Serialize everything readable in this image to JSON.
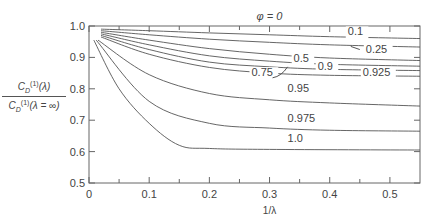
{
  "chart_data": {
    "type": "line",
    "title": "φ = 0",
    "xlabel": "1/λ",
    "ylabel": "C_D^(1)(λ) / C_D^(1)(λ = ∞)",
    "xlim": [
      0,
      0.55
    ],
    "ylim": [
      0.5,
      1.0
    ],
    "xticks": [
      "0",
      "0.1",
      "0.2",
      "0.3",
      "0.4",
      "0.5"
    ],
    "yticks": [
      "0.5",
      "0.6",
      "0.7",
      "0.8",
      "0.9",
      "1.0"
    ],
    "grid": false,
    "series": [
      {
        "name": "0.1",
        "x": [
          0.02,
          0.1,
          0.2,
          0.3,
          0.4,
          0.55
        ],
        "y": [
          0.99,
          0.985,
          0.978,
          0.972,
          0.966,
          0.96
        ]
      },
      {
        "name": "0.25",
        "x": [
          0.02,
          0.1,
          0.2,
          0.3,
          0.4,
          0.55
        ],
        "y": [
          0.985,
          0.972,
          0.958,
          0.948,
          0.94,
          0.933
        ]
      },
      {
        "name": "0.5",
        "x": [
          0.02,
          0.1,
          0.2,
          0.3,
          0.4,
          0.55
        ],
        "y": [
          0.98,
          0.955,
          0.928,
          0.91,
          0.898,
          0.89
        ]
      },
      {
        "name": "0.75",
        "x": [
          0.02,
          0.1,
          0.2,
          0.3,
          0.4,
          0.55
        ],
        "y": [
          0.975,
          0.94,
          0.905,
          0.888,
          0.878,
          0.872
        ]
      },
      {
        "name": "0.9",
        "x": [
          0.02,
          0.1,
          0.2,
          0.3,
          0.4,
          0.55
        ],
        "y": [
          0.97,
          0.925,
          0.885,
          0.87,
          0.862,
          0.858
        ]
      },
      {
        "name": "0.925",
        "x": [
          0.02,
          0.1,
          0.2,
          0.3,
          0.4,
          0.55
        ],
        "y": [
          0.965,
          0.91,
          0.868,
          0.85,
          0.843,
          0.84
        ]
      },
      {
        "name": "0.95",
        "x": [
          0.015,
          0.1,
          0.2,
          0.3,
          0.4,
          0.55
        ],
        "y": [
          0.955,
          0.845,
          0.785,
          0.765,
          0.755,
          0.745
        ]
      },
      {
        "name": "0.975",
        "x": [
          0.012,
          0.1,
          0.2,
          0.3,
          0.4,
          0.55
        ],
        "y": [
          0.955,
          0.76,
          0.69,
          0.675,
          0.668,
          0.665
        ]
      },
      {
        "name": "1.0",
        "x": [
          0.008,
          0.05,
          0.1,
          0.15,
          0.2,
          0.3,
          0.55
        ],
        "y": [
          0.955,
          0.8,
          0.69,
          0.62,
          0.61,
          0.607,
          0.605
        ]
      }
    ],
    "annotations": [
      "φ = 0",
      "0.1",
      "0.25",
      "0.5",
      "0.75",
      "0.9",
      "0.925",
      "0.95",
      "0.975",
      "1.0"
    ]
  }
}
